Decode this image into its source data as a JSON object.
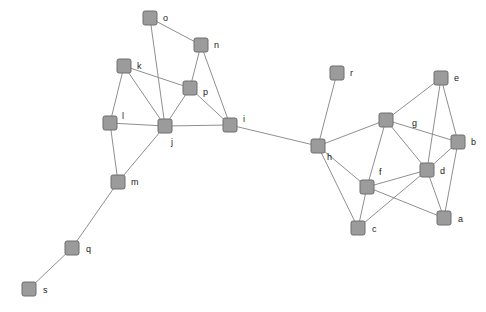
{
  "diagram": {
    "type": "node-link-graph",
    "title": "",
    "width": 486,
    "height": 312,
    "background": "#ffffff",
    "node_style": {
      "shape": "rounded-square",
      "size": 14,
      "corner_radius": 2,
      "fill": "#9b9b9b",
      "stroke": "#6e6e6e",
      "stroke_width": 1
    },
    "edge_style": {
      "stroke": "#8f8f8f",
      "stroke_width": 1,
      "directed": false
    },
    "label_style": {
      "color": "#1a1a1a",
      "font_size": 9
    },
    "node_count": 19,
    "edge_count": 38,
    "nodes": [
      {
        "id": "o",
        "label": "o",
        "x": 150,
        "y": 18,
        "label_dx": 13,
        "label_dy": 1
      },
      {
        "id": "n",
        "label": "n",
        "x": 201,
        "y": 45,
        "label_dx": 13,
        "label_dy": 1
      },
      {
        "id": "k",
        "label": "k",
        "x": 124,
        "y": 66,
        "label_dx": 13,
        "label_dy": 1
      },
      {
        "id": "r",
        "label": "r",
        "x": 337,
        "y": 73,
        "label_dx": 13,
        "label_dy": 1
      },
      {
        "id": "e",
        "label": "e",
        "x": 441,
        "y": 78,
        "label_dx": 13,
        "label_dy": 1
      },
      {
        "id": "p",
        "label": "p",
        "x": 190,
        "y": 88,
        "label_dx": 13,
        "label_dy": 5
      },
      {
        "id": "g",
        "label": "g",
        "x": 386,
        "y": 120,
        "label_dx": 26,
        "label_dy": 4
      },
      {
        "id": "l",
        "label": "l",
        "x": 110,
        "y": 123,
        "label_dx": 12,
        "label_dy": -6
      },
      {
        "id": "j",
        "label": "j",
        "x": 165,
        "y": 126,
        "label_dx": 6,
        "label_dy": 17
      },
      {
        "id": "i",
        "label": "i",
        "x": 230,
        "y": 125,
        "label_dx": 13,
        "label_dy": -5
      },
      {
        "id": "b",
        "label": "b",
        "x": 458,
        "y": 142,
        "label_dx": 13,
        "label_dy": 1
      },
      {
        "id": "h",
        "label": "h",
        "x": 318,
        "y": 146,
        "label_dx": 9,
        "label_dy": 12
      },
      {
        "id": "d",
        "label": "d",
        "x": 427,
        "y": 170,
        "label_dx": 13,
        "label_dy": 2
      },
      {
        "id": "m",
        "label": "m",
        "x": 118,
        "y": 182,
        "label_dx": 13,
        "label_dy": 1
      },
      {
        "id": "f",
        "label": "f",
        "x": 367,
        "y": 187,
        "label_dx": 12,
        "label_dy": -14
      },
      {
        "id": "a",
        "label": "a",
        "x": 444,
        "y": 218,
        "label_dx": 14,
        "label_dy": 2
      },
      {
        "id": "c",
        "label": "c",
        "x": 358,
        "y": 228,
        "label_dx": 14,
        "label_dy": 2
      },
      {
        "id": "q",
        "label": "q",
        "x": 72,
        "y": 248,
        "label_dx": 14,
        "label_dy": 2
      },
      {
        "id": "s",
        "label": "s",
        "x": 29,
        "y": 289,
        "label_dx": 14,
        "label_dy": 2
      }
    ],
    "edges": [
      {
        "source": "o",
        "target": "n"
      },
      {
        "source": "o",
        "target": "j"
      },
      {
        "source": "n",
        "target": "p"
      },
      {
        "source": "n",
        "target": "i"
      },
      {
        "source": "k",
        "target": "l"
      },
      {
        "source": "k",
        "target": "j"
      },
      {
        "source": "k",
        "target": "p"
      },
      {
        "source": "p",
        "target": "j"
      },
      {
        "source": "p",
        "target": "i"
      },
      {
        "source": "l",
        "target": "j"
      },
      {
        "source": "l",
        "target": "m"
      },
      {
        "source": "j",
        "target": "i"
      },
      {
        "source": "j",
        "target": "m"
      },
      {
        "source": "i",
        "target": "h"
      },
      {
        "source": "m",
        "target": "q"
      },
      {
        "source": "q",
        "target": "s"
      },
      {
        "source": "h",
        "target": "r"
      },
      {
        "source": "h",
        "target": "g"
      },
      {
        "source": "h",
        "target": "f"
      },
      {
        "source": "h",
        "target": "c"
      },
      {
        "source": "g",
        "target": "e"
      },
      {
        "source": "g",
        "target": "b"
      },
      {
        "source": "g",
        "target": "f"
      },
      {
        "source": "g",
        "target": "d"
      },
      {
        "source": "e",
        "target": "b"
      },
      {
        "source": "e",
        "target": "d"
      },
      {
        "source": "b",
        "target": "d"
      },
      {
        "source": "b",
        "target": "a"
      },
      {
        "source": "d",
        "target": "f"
      },
      {
        "source": "d",
        "target": "a"
      },
      {
        "source": "d",
        "target": "c"
      },
      {
        "source": "f",
        "target": "c"
      },
      {
        "source": "f",
        "target": "a"
      }
    ]
  }
}
